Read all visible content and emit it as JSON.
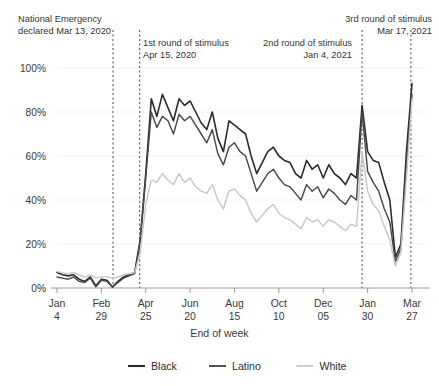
{
  "chart_data": {
    "type": "line",
    "title": "",
    "xlabel": "End of week",
    "ylabel": "",
    "ylim": [
      0,
      100
    ],
    "ytick_values": [
      0,
      20,
      40,
      60,
      80,
      100
    ],
    "ytick_labels": [
      "0%",
      "20%",
      "40%",
      "60%",
      "80%",
      "100%"
    ],
    "grid": true,
    "legend_position": "bottom",
    "xtick_index": [
      0,
      8,
      16,
      24,
      32,
      40,
      48,
      56,
      64
    ],
    "xtick_labels_top": [
      "Jan",
      "Feb",
      "Apr",
      "Jun",
      "Aug",
      "Oct",
      "Dec",
      "Jan",
      "Mar"
    ],
    "xtick_labels_bottom": [
      "4",
      "29",
      "25",
      "20",
      "15",
      "10",
      "05",
      "30",
      "27"
    ],
    "x_count": 65,
    "series": [
      {
        "name": "Black",
        "color": "#2b2b2b",
        "width": 1.6,
        "values": [
          7,
          6,
          5.5,
          6,
          4,
          3,
          5,
          1,
          4,
          3.5,
          0.5,
          3,
          5,
          6,
          7,
          22,
          52,
          86,
          78,
          88,
          82,
          76,
          86,
          83,
          85,
          80,
          75,
          72,
          80,
          68,
          62,
          76,
          74,
          72,
          70,
          60,
          52,
          57,
          62,
          64,
          60,
          58,
          57,
          52,
          50,
          58,
          54,
          56,
          50,
          56,
          52,
          50,
          47,
          52,
          50,
          83,
          62,
          58,
          57,
          48,
          40,
          14,
          20,
          62,
          93
        ]
      },
      {
        "name": "Latino",
        "color": "#4a4a4a",
        "width": 1.45,
        "values": [
          5,
          4.5,
          4,
          5,
          3,
          2.5,
          4.5,
          0.5,
          3.5,
          3,
          0.5,
          2.5,
          4.5,
          5.5,
          6.5,
          21,
          50,
          80,
          73,
          78,
          76,
          70,
          79,
          76,
          78,
          74,
          70,
          66,
          72,
          61,
          56,
          64,
          66,
          62,
          60,
          52,
          44,
          48,
          52,
          54,
          50,
          47,
          46,
          43,
          40,
          47,
          44,
          46,
          41,
          45,
          43,
          40,
          38,
          42,
          40,
          80,
          53,
          48,
          44,
          36,
          30,
          12,
          18,
          56,
          88
        ]
      },
      {
        "name": "White",
        "color": "#c8c8c8",
        "width": 1.45,
        "values": [
          7.5,
          7,
          6.5,
          7,
          6,
          5,
          6,
          4.5,
          5,
          5,
          4.5,
          5,
          6,
          6.5,
          7,
          16,
          38,
          49,
          48,
          52,
          49,
          47,
          52,
          48,
          50,
          46,
          44,
          43,
          47,
          40,
          36,
          44,
          45,
          42,
          40,
          34,
          30,
          33,
          36,
          38,
          34,
          32,
          31,
          29,
          27,
          32,
          30,
          31,
          28,
          31,
          30,
          28,
          26,
          29,
          28,
          62,
          44,
          38,
          35,
          28,
          22,
          10,
          16,
          50,
          86
        ]
      }
    ],
    "annotations": [
      {
        "id": "national-emergency",
        "lines": [
          "National Emergency",
          "declared Mar 13, 2020"
        ],
        "x_index": 10.1,
        "align": "left",
        "text_x": 18,
        "text_y": 22
      },
      {
        "id": "first-stimulus",
        "lines": [
          "1st round of stimulus",
          "Apr 15, 2020"
        ],
        "x_index": 14.9,
        "align": "left",
        "text_x": 143,
        "text_y": 46
      },
      {
        "id": "second-stimulus",
        "lines": [
          "2nd round of stimulus",
          "Jan 4, 2021"
        ],
        "x_index": 55.0,
        "align": "right",
        "text_x": 352,
        "text_y": 46
      },
      {
        "id": "third-stimulus",
        "lines": [
          "3rd round of stimulus",
          "Mar 17, 2021"
        ],
        "x_index": 63.8,
        "align": "right",
        "text_x": 432,
        "text_y": 22
      }
    ],
    "legend": [
      {
        "label": "Black",
        "color": "#2b2b2b",
        "width": 2.1
      },
      {
        "label": "Latino",
        "color": "#4a4a4a",
        "width": 1.9
      },
      {
        "label": "White",
        "color": "#c8c8c8",
        "width": 1.7
      }
    ]
  }
}
